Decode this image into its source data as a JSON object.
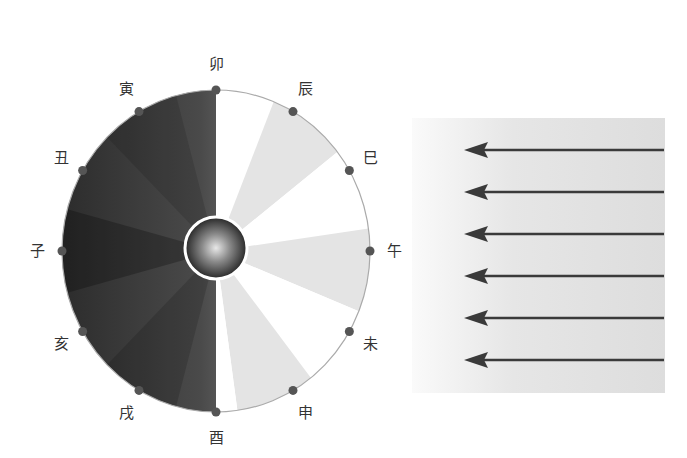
{
  "diagram": {
    "title": "",
    "type": "earth-rotation-day-night-zodiac-hours",
    "center_object": "earth-sphere",
    "dial": {
      "branches": [
        {
          "name": "卯",
          "angle_deg": -90
        },
        {
          "name": "辰",
          "angle_deg": -60
        },
        {
          "name": "巳",
          "angle_deg": -30
        },
        {
          "name": "午",
          "angle_deg": 0
        },
        {
          "name": "未",
          "angle_deg": 30
        },
        {
          "name": "申",
          "angle_deg": 60
        },
        {
          "name": "酉",
          "angle_deg": 90
        },
        {
          "name": "戌",
          "angle_deg": 120
        },
        {
          "name": "亥",
          "angle_deg": 150
        },
        {
          "name": "子",
          "angle_deg": 180
        },
        {
          "name": "丑",
          "angle_deg": 210
        },
        {
          "name": "寅",
          "angle_deg": 240
        }
      ],
      "lit_side": "right",
      "dark_side": "left"
    },
    "light_source": {
      "arrow_count": 6,
      "direction": "right-to-left",
      "arrow_color": "#3a3a3a",
      "panel_color": "#e2e2e2"
    },
    "colors": {
      "dot": "#555555",
      "rim": "#aaaaaa",
      "light_wedge": "#e4e4e4",
      "white_wedge": "#ffffff",
      "darkest": "#2e2e2e"
    }
  }
}
